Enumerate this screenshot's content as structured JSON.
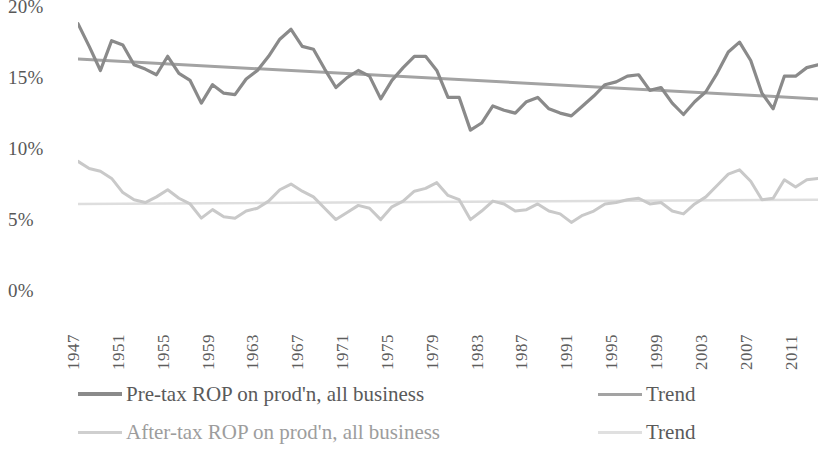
{
  "chart_data": {
    "type": "line",
    "title": "",
    "xlabel": "",
    "ylabel": "",
    "xlim": [
      1947,
      2013
    ],
    "ylim": [
      0,
      20
    ],
    "y_ticks": [
      "0%",
      "5%",
      "10%",
      "15%",
      "20%"
    ],
    "y_tick_values": [
      0,
      5,
      10,
      15,
      20
    ],
    "grid": false,
    "legend_position": "bottom",
    "x": [
      1947,
      1948,
      1949,
      1950,
      1951,
      1952,
      1953,
      1954,
      1955,
      1956,
      1957,
      1958,
      1959,
      1960,
      1961,
      1962,
      1963,
      1964,
      1965,
      1966,
      1967,
      1968,
      1969,
      1970,
      1971,
      1972,
      1973,
      1974,
      1975,
      1976,
      1977,
      1978,
      1979,
      1980,
      1981,
      1982,
      1983,
      1984,
      1985,
      1986,
      1987,
      1988,
      1989,
      1990,
      1991,
      1992,
      1993,
      1994,
      1995,
      1996,
      1997,
      1998,
      1999,
      2000,
      2001,
      2002,
      2003,
      2004,
      2005,
      2006,
      2007,
      2008,
      2009,
      2010,
      2011,
      2012,
      2013
    ],
    "x_tick_labels": [
      "1947",
      "1951",
      "1955",
      "1959",
      "1963",
      "1967",
      "1971",
      "1975",
      "1979",
      "1983",
      "1987",
      "1991",
      "1995",
      "1999",
      "2003",
      "2007",
      "2011"
    ],
    "x_tick_values": [
      1947,
      1951,
      1955,
      1959,
      1963,
      1967,
      1971,
      1975,
      1979,
      1983,
      1987,
      1991,
      1995,
      1999,
      2003,
      2007,
      2011
    ],
    "series": [
      {
        "name": "Pre-tax ROP on prod'n, all business",
        "color": "#8a8a8a",
        "width": 3.2,
        "values": [
          18.9,
          17.3,
          15.6,
          17.7,
          17.4,
          16.0,
          15.7,
          15.3,
          16.6,
          15.4,
          14.9,
          13.3,
          14.6,
          14.0,
          13.9,
          15.0,
          15.6,
          16.6,
          17.8,
          18.5,
          17.3,
          17.1,
          15.7,
          14.4,
          15.1,
          15.6,
          15.2,
          13.6,
          14.9,
          15.8,
          16.6,
          16.6,
          15.6,
          13.7,
          13.7,
          11.4,
          11.9,
          13.1,
          12.8,
          12.6,
          13.4,
          13.7,
          12.9,
          12.6,
          12.4,
          13.1,
          13.8,
          14.6,
          14.8,
          15.2,
          15.3,
          14.2,
          14.4,
          13.3,
          12.5,
          13.4,
          14.1,
          15.4,
          16.9,
          17.6,
          16.3,
          14.0,
          12.9,
          15.2,
          15.2,
          15.8,
          16.0
        ]
      },
      {
        "name": "After-tax ROP on prod'n, all business",
        "color": "#c9c9c9",
        "width": 3.0,
        "values": [
          9.2,
          8.7,
          8.5,
          8.0,
          7.0,
          6.5,
          6.3,
          6.7,
          7.2,
          6.6,
          6.2,
          5.2,
          5.8,
          5.3,
          5.2,
          5.7,
          5.9,
          6.4,
          7.2,
          7.6,
          7.1,
          6.7,
          5.9,
          5.1,
          5.6,
          6.1,
          5.9,
          5.1,
          6.0,
          6.4,
          7.1,
          7.3,
          7.7,
          6.8,
          6.5,
          5.1,
          5.7,
          6.4,
          6.2,
          5.7,
          5.8,
          6.2,
          5.7,
          5.5,
          4.9,
          5.4,
          5.7,
          6.2,
          6.3,
          6.5,
          6.6,
          6.2,
          6.3,
          5.7,
          5.5,
          6.2,
          6.7,
          7.5,
          8.3,
          8.6,
          7.8,
          6.5,
          6.6,
          7.9,
          7.4,
          7.9,
          8.0
        ]
      }
    ],
    "trendlines": [
      {
        "name": "Trend",
        "for_series": "Pre-tax ROP on prod'n, all business",
        "color": "#a3a3a3",
        "width": 3.0,
        "start_value": 16.4,
        "end_value": 13.6
      },
      {
        "name": "Trend",
        "for_series": "After-tax ROP on prod'n, all business",
        "color": "#dedede",
        "width": 2.6,
        "start_value": 6.2,
        "end_value": 6.5
      }
    ]
  },
  "legend": {
    "entries": [
      {
        "label": "Pre-tax ROP on prod'n, all business",
        "color": "#8a8a8a",
        "width": 4,
        "faint": false,
        "row": 0,
        "col": 0
      },
      {
        "label": "Trend",
        "color": "#a3a3a3",
        "width": 3,
        "faint": false,
        "row": 0,
        "col": 1
      },
      {
        "label": "After-tax ROP on prod'n, all business",
        "color": "#cfcfcf",
        "width": 3,
        "faint": true,
        "row": 1,
        "col": 0
      },
      {
        "label": "Trend",
        "color": "#e0e0e0",
        "width": 3,
        "faint": false,
        "row": 1,
        "col": 1
      }
    ]
  }
}
